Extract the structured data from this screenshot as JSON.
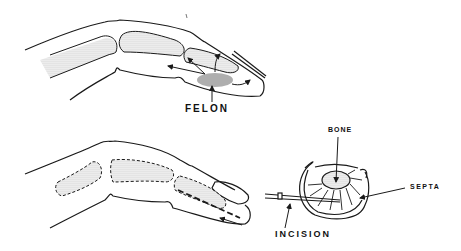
{
  "figure": {
    "panels": [
      {
        "id": "top",
        "description": "Lateral view of finger with felon at distal pulp"
      },
      {
        "id": "bottom",
        "description": "Lateral view of finger showing incision line and cross-section of fingertip"
      }
    ],
    "labels": {
      "felon": "FELON",
      "bone": "BONE",
      "septa": "SEPTA",
      "incision": "INCISION"
    },
    "colors": {
      "line": "#1a1a1a",
      "stipple": "#bdbdbd",
      "abscess": "#8c8c8c",
      "background": "#ffffff"
    }
  }
}
